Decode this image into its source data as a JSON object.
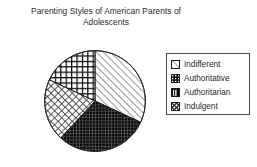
{
  "chart": {
    "title": "Parenting Styles of American Parents of\nAdolescents",
    "title_line1": "Parenting Styles of American Parents of",
    "title_line2": "Adolescents"
  },
  "legend": {
    "position": "right",
    "items": [
      {
        "label": "Indifferent",
        "pattern": "diagonal-hatch",
        "swatch_icon": "diagonal-hatch-swatch-icon"
      },
      {
        "label": "Authoritative",
        "pattern": "bold-grid",
        "swatch_icon": "bold-grid-swatch-icon"
      },
      {
        "label": "Authoritarian",
        "pattern": "fine-dark-grid",
        "swatch_icon": "fine-dark-grid-swatch-icon"
      },
      {
        "label": "Indulgent",
        "pattern": "diamond-check",
        "swatch_icon": "diamond-check-swatch-icon"
      }
    ]
  },
  "chart_data": {
    "type": "pie",
    "title": "Parenting Styles of American Parents of Adolescents",
    "xlabel": "",
    "ylabel": "",
    "grid": false,
    "legend_position": "right",
    "start_angle_deg": 0,
    "direction": "clockwise",
    "categories": [
      "Indifferent",
      "Authoritative",
      "Authoritarian",
      "Indulgent"
    ],
    "values": [
      32,
      18,
      30,
      20
    ],
    "unit": "percent",
    "slices": [
      {
        "label": "Indifferent",
        "value": 32,
        "start_deg": 0,
        "end_deg": 115,
        "pattern": "diagonal-hatch",
        "fill": "#ffffff",
        "ink": "#3a3a3a"
      },
      {
        "label": "Authoritarian",
        "value": 30,
        "start_deg": 115,
        "end_deg": 223,
        "pattern": "fine-dark-grid",
        "fill": "#101010",
        "ink": "#6d6d6d"
      },
      {
        "label": "Indulgent",
        "value": 20,
        "start_deg": 223,
        "end_deg": 295,
        "pattern": "diamond-check",
        "fill": "#ffffff",
        "ink": "#3a3a3a"
      },
      {
        "label": "Authoritative",
        "value": 18,
        "start_deg": 295,
        "end_deg": 360,
        "pattern": "bold-grid",
        "fill": "#ffffff",
        "ink": "#101010"
      }
    ]
  }
}
